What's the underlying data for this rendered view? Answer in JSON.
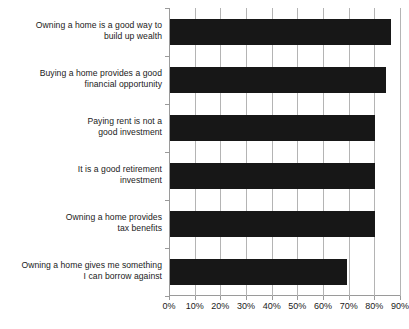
{
  "chart_data": {
    "type": "bar",
    "orientation": "horizontal",
    "title": "",
    "subtitle": "",
    "xlabel": "",
    "ylabel": "",
    "xlim": [
      0,
      90
    ],
    "ylim": null,
    "grid": true,
    "legend": null,
    "legend_position": "none",
    "bar_color": "#171717",
    "grid_color": "#b4b4b4",
    "axis_color": "#9a9a9a",
    "tick_suffix": "%",
    "categories": [
      "Owning a home is a good way to\nbuild up wealth",
      "Buying a home provides a good\nfinancial opportunity",
      "Paying rent is not a\ngood investment",
      "It is a good retirement\ninvestment",
      "Owning a home provides\ntax benefits",
      "Owning a home gives me something\nI can borrow against"
    ],
    "values": [
      86,
      84,
      80,
      80,
      80,
      69
    ],
    "xticks": [
      0,
      10,
      20,
      30,
      40,
      50,
      60,
      70,
      80,
      90
    ],
    "xticklabels": [
      "0%",
      "10%",
      "20%",
      "30%",
      "40%",
      "50%",
      "60%",
      "70%",
      "80%",
      "90%"
    ]
  }
}
